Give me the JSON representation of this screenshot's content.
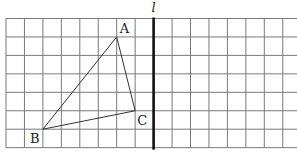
{
  "diagram": {
    "type": "grid-geometry",
    "grid": {
      "origin_x": 6,
      "origin_y": 18.5,
      "cell": 18.45,
      "cols": 16,
      "rows": 7,
      "right_edge": 297,
      "line_color": "#7a7a7a"
    },
    "axis_line": {
      "label": "l",
      "col": 8,
      "color": "#111111"
    },
    "points": [
      {
        "label": "A",
        "col": 6,
        "row": 1,
        "label_dx": 3,
        "label_dy": -4
      },
      {
        "label": "B",
        "col": 2,
        "row": 6,
        "label_dx": -13,
        "label_dy": 14
      },
      {
        "label": "C",
        "col": 7,
        "row": 5,
        "label_dx": 2,
        "label_dy": 14
      }
    ],
    "triangle": [
      "A",
      "B",
      "C"
    ],
    "triangle_color": "#333333"
  }
}
